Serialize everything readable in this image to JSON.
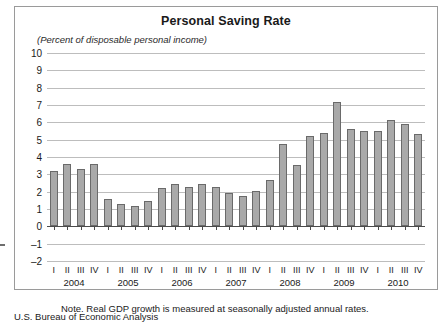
{
  "chart_data": {
    "type": "bar",
    "title": "Personal Saving Rate",
    "subtitle": "(Percent of disposable personal income)",
    "xlabel": "",
    "ylabel": "",
    "ylim": [
      -2,
      10
    ],
    "yticks": [
      10,
      9,
      8,
      7,
      6,
      5,
      4,
      3,
      2,
      1,
      0,
      -1,
      -2
    ],
    "grid": true,
    "legend": "none",
    "years": [
      "2004",
      "2005",
      "2006",
      "2007",
      "2008",
      "2009",
      "2010"
    ],
    "quarter_labels": [
      "I",
      "II",
      "III",
      "IV"
    ],
    "categories": [
      "2004 I",
      "2004 II",
      "2004 III",
      "2004 IV",
      "2005 I",
      "2005 II",
      "2005 III",
      "2005 IV",
      "2006 I",
      "2006 II",
      "2006 III",
      "2006 IV",
      "2007 I",
      "2007 II",
      "2007 III",
      "2007 IV",
      "2008 I",
      "2008 II",
      "2008 III",
      "2008 IV",
      "2009 I",
      "2009 II",
      "2009 III",
      "2009 IV",
      "2010 I",
      "2010 II",
      "2010 III",
      "2010 IV"
    ],
    "values": [
      3.2,
      3.6,
      3.3,
      3.6,
      1.55,
      1.3,
      1.15,
      1.45,
      2.2,
      2.45,
      2.25,
      2.45,
      2.25,
      1.95,
      1.75,
      2.05,
      2.65,
      4.75,
      3.55,
      5.2,
      5.4,
      7.15,
      5.6,
      5.5,
      5.5,
      6.15,
      5.9,
      5.35
    ],
    "bar_color": "#a9a9a9",
    "bar_border_color": "#6a6a6a",
    "grid_color": "#bdbdbd",
    "axis_color": "#4a4a4a"
  },
  "note": "Note.  Real GDP growth is measured at seasonally adjusted annual rates.",
  "source": "U.S. Bureau of Economic Analysis"
}
